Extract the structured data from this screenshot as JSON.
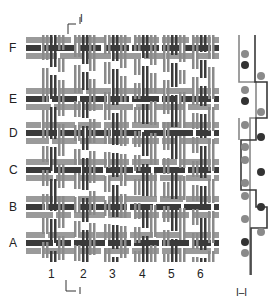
{
  "diagram": {
    "row_labels": [
      "F",
      "E",
      "D",
      "C",
      "B",
      "A"
    ],
    "column_labels": [
      "1",
      "2",
      "3",
      "4",
      "5",
      "6"
    ],
    "section_marker_top": "I",
    "section_marker_bottom": "I",
    "section_label": "I–I",
    "colors": {
      "dark_thread": "#3a3a3a",
      "light_thread": "#8a8a8a",
      "mid_thread": "#9a9a9a",
      "section_line_dark": "#3a3a3a",
      "section_line_light": "#888888",
      "dot_dark": "#333333",
      "dot_light": "#8a8a8a"
    },
    "rows": [
      {
        "label": "F",
        "y": 48
      },
      {
        "label": "E",
        "y": 99
      },
      {
        "label": "D",
        "y": 133
      },
      {
        "label": "C",
        "y": 170
      },
      {
        "label": "B",
        "y": 207
      },
      {
        "label": "A",
        "y": 243
      }
    ],
    "columns": [
      {
        "label": "1",
        "x": 51
      },
      {
        "label": "2",
        "x": 83
      },
      {
        "label": "3",
        "x": 112
      },
      {
        "label": "4",
        "x": 142
      },
      {
        "label": "5",
        "x": 171
      },
      {
        "label": "6",
        "x": 200
      }
    ]
  }
}
